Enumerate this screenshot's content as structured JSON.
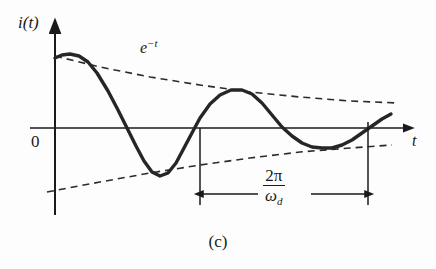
{
  "figure": {
    "caption": "(c)",
    "background_color": "#fdfdfd",
    "ink_color": "#1a1a1a"
  },
  "labels": {
    "y_axis": "i(t)",
    "x_axis": "t",
    "origin": "0",
    "envelope_base": "e",
    "envelope_exponent": "−t",
    "period_numerator": "2π",
    "period_denominator_base": "ω",
    "period_denominator_sub": "d"
  },
  "chart_data": {
    "type": "line",
    "title": "",
    "subtitle": "",
    "xlabel": "t",
    "ylabel": "i(t)",
    "grid": false,
    "legend": false,
    "axis_origin_label": "0",
    "annotations": [
      {
        "name": "envelope-label",
        "text": "e^-t",
        "x_px": 140,
        "y_px": 38
      },
      {
        "name": "period-dimension-label",
        "text": "2π/ω_d",
        "x_px": 258,
        "y_px": 167
      }
    ],
    "dimension_line": {
      "name": "damped-period",
      "label": "2π/ω_d",
      "left_x_px": 200,
      "right_x_px": 368,
      "y_px": 194,
      "tick_top_y_px": 128,
      "tick_bottom_y_px": 205
    },
    "series": [
      {
        "name": "damped-oscillation",
        "style": "solid",
        "stroke_width_px": 3.4,
        "color": "#262626",
        "description": "underdamped decaying sinusoid i(t)",
        "points_px": [
          [
            55,
            58
          ],
          [
            62,
            55
          ],
          [
            70,
            54
          ],
          [
            79,
            56
          ],
          [
            88,
            62
          ],
          [
            97,
            73
          ],
          [
            108,
            91
          ],
          [
            118,
            110
          ],
          [
            128,
            130
          ],
          [
            136,
            146
          ],
          [
            144,
            161
          ],
          [
            152,
            172
          ],
          [
            160,
            176
          ],
          [
            168,
            173
          ],
          [
            176,
            163
          ],
          [
            184,
            148
          ],
          [
            193,
            131
          ],
          [
            200,
            118
          ],
          [
            210,
            104
          ],
          [
            220,
            95
          ],
          [
            231,
            90
          ],
          [
            242,
            90
          ],
          [
            252,
            94
          ],
          [
            262,
            103
          ],
          [
            272,
            115
          ],
          [
            282,
            127
          ],
          [
            292,
            136
          ],
          [
            302,
            143
          ],
          [
            312,
            147
          ],
          [
            322,
            148
          ],
          [
            332,
            148
          ],
          [
            342,
            145
          ],
          [
            352,
            140
          ],
          [
            362,
            133
          ],
          [
            372,
            126
          ],
          [
            382,
            119
          ],
          [
            391,
            114
          ]
        ]
      },
      {
        "name": "upper-envelope",
        "style": "dashed",
        "stroke_width_px": 1.6,
        "color": "#2b2b2b",
        "description": "positive exponential envelope e^-t",
        "points_px": [
          [
            55,
            56
          ],
          [
            100,
            67
          ],
          [
            150,
            77
          ],
          [
            200,
            85
          ],
          [
            250,
            92
          ],
          [
            300,
            97
          ],
          [
            350,
            101
          ],
          [
            398,
            103
          ]
        ]
      },
      {
        "name": "lower-envelope",
        "style": "dashed",
        "stroke_width_px": 1.6,
        "color": "#2b2b2b",
        "description": "negative exponential envelope -e^-t",
        "points_px": [
          [
            47,
            192
          ],
          [
            100,
            182
          ],
          [
            150,
            173
          ],
          [
            200,
            165
          ],
          [
            250,
            158
          ],
          [
            300,
            152
          ],
          [
            350,
            148
          ],
          [
            392,
            145
          ]
        ]
      }
    ],
    "axes": {
      "x_axis_y_px": 128,
      "y_axis_x_px": 55,
      "x_axis_start_px": 30,
      "x_axis_end_px": 412,
      "y_axis_top_px": 25,
      "y_axis_bottom_px": 215,
      "x_arrow": true,
      "y_arrow": true
    }
  }
}
